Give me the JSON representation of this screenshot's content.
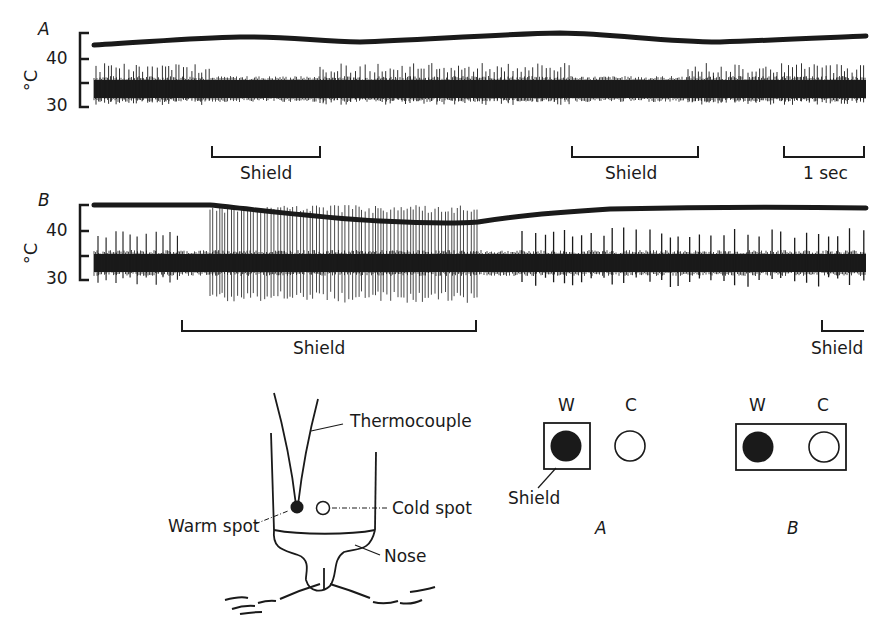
{
  "figure": {
    "panel_A": {
      "label": "A",
      "y_axis": {
        "unit": "°C",
        "ticks": [
          "40",
          "30"
        ]
      },
      "bars": [
        {
          "label": "Shield",
          "x1": 212,
          "x2": 320
        },
        {
          "label": "Shield",
          "x1": 572,
          "x2": 698
        },
        {
          "label": "1 sec",
          "x1": 784,
          "x2": 864
        }
      ]
    },
    "panel_B": {
      "label": "B",
      "y_axis": {
        "unit": "°C",
        "ticks": [
          "40",
          "30"
        ]
      },
      "bars": [
        {
          "label": "Shield",
          "x1": 182,
          "x2": 476
        },
        {
          "label": "Shield",
          "x1": 822,
          "x2": 864
        }
      ]
    },
    "schematic": {
      "thermocouple": "Thermocouple",
      "cold_spot": "Cold spot",
      "warm_spot": "Warm spot",
      "nose": "Nose"
    },
    "shield_configs": {
      "A": {
        "label": "A",
        "warm": "W",
        "cold": "C",
        "shield_label": "Shield"
      },
      "B": {
        "label": "B",
        "warm": "W",
        "cold": "C"
      }
    }
  },
  "chart_data": [
    {
      "type": "line",
      "title": "A",
      "ylabel": "°C",
      "yticks": [
        30,
        40
      ],
      "ylim": [
        30,
        45
      ],
      "series": [
        {
          "name": "temperature",
          "description": "skin temperature trace near 43-44 °C, slowly oscillating",
          "x": [
            0,
            0.25,
            0.5,
            0.75,
            1.0
          ],
          "values": [
            43,
            44,
            43.5,
            44.5,
            44
          ]
        },
        {
          "name": "nerve discharge",
          "description": "impulses from cold fibre; burst activity during shield periods"
        }
      ],
      "annotations": [
        "Shield",
        "Shield",
        "1 sec"
      ]
    },
    {
      "type": "line",
      "title": "B",
      "ylabel": "°C",
      "yticks": [
        30,
        40
      ],
      "ylim": [
        30,
        45
      ],
      "series": [
        {
          "name": "temperature",
          "description": "temperature drops from ~45 to ~41 during shield, then recovers",
          "x": [
            0,
            0.18,
            0.45,
            0.6,
            1.0
          ],
          "values": [
            45,
            45,
            41.5,
            44,
            45
          ]
        },
        {
          "name": "nerve discharge",
          "description": "high-frequency large impulses during shield period"
        }
      ],
      "annotations": [
        "Shield",
        "Shield"
      ]
    }
  ]
}
